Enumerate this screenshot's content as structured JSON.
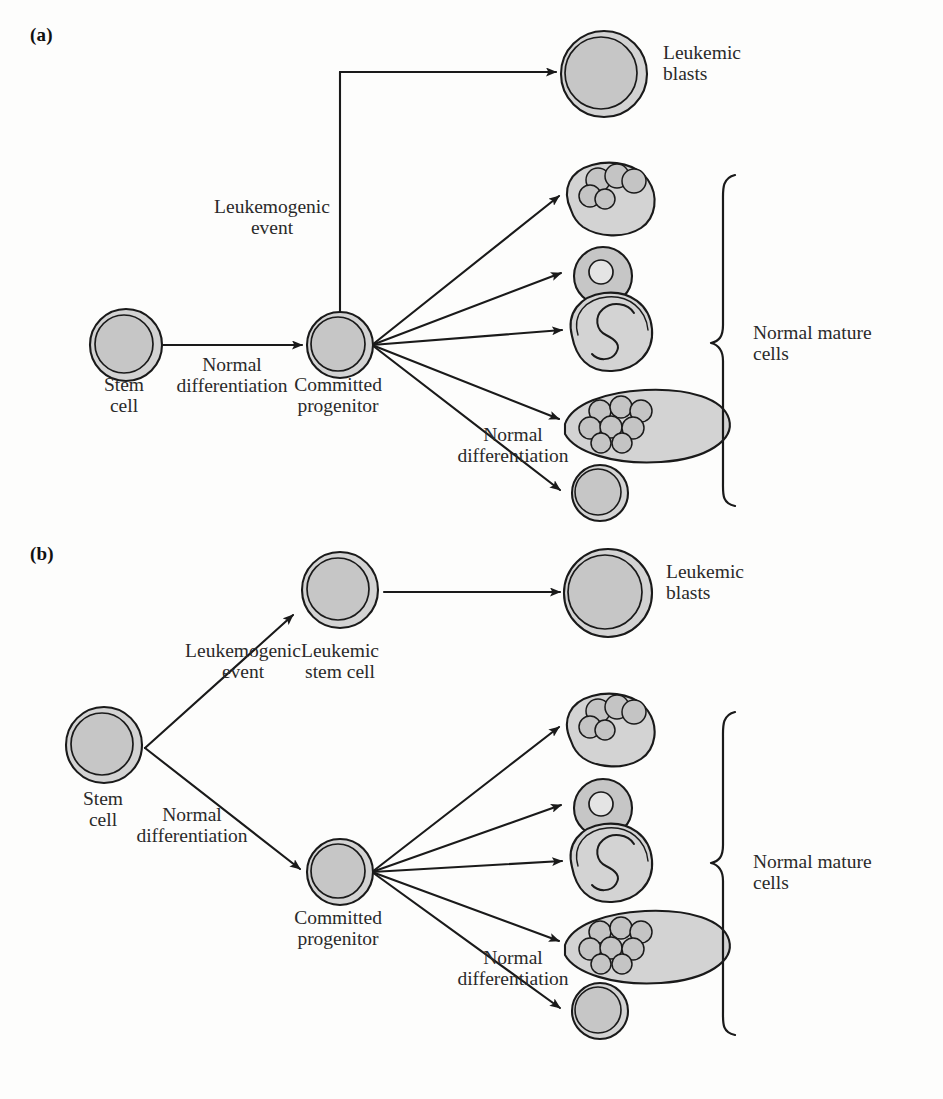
{
  "figure": {
    "width": 943,
    "height": 1099,
    "background": "#fdfdfc",
    "ink": "#1a1a1a",
    "cell_fill": "#c6c6c6",
    "cell_fill_light": "#d3d3d3",
    "nucleus_fill": "#bdbdbd"
  },
  "panels": [
    {
      "letter": "(a)",
      "nodes": {
        "stem_cell": "Stem\ncell",
        "committed_progenitor": "Committed\nprogenitor",
        "leukemic_blasts": "Leukemic\nblasts",
        "normal_mature_cells": "Normal mature\ncells"
      },
      "arrow_labels": {
        "leukemogenic_event": "Leukemogenic\nevent",
        "normal_differentiation_1": "Normal\ndifferentiation",
        "normal_differentiation_2": "Normal\ndifferentiation"
      },
      "mature_cell_types": [
        "granulocyte",
        "lymphocyte",
        "monocyte",
        "megakaryocyte",
        "erythrocyte"
      ]
    },
    {
      "letter": "(b)",
      "nodes": {
        "stem_cell": "Stem\ncell",
        "leukemic_stem_cell": "Leukemic\nstem cell",
        "committed_progenitor": "Committed\nprogenitor",
        "leukemic_blasts": "Leukemic\nblasts",
        "normal_mature_cells": "Normal mature\ncells"
      },
      "arrow_labels": {
        "leukemogenic_event": "Leukemogenic\nevent",
        "normal_differentiation_1": "Normal\ndifferentiation",
        "normal_differentiation_2": "Normal\ndifferentiation"
      },
      "mature_cell_types": [
        "granulocyte",
        "lymphocyte",
        "monocyte",
        "megakaryocyte",
        "erythrocyte"
      ]
    }
  ]
}
